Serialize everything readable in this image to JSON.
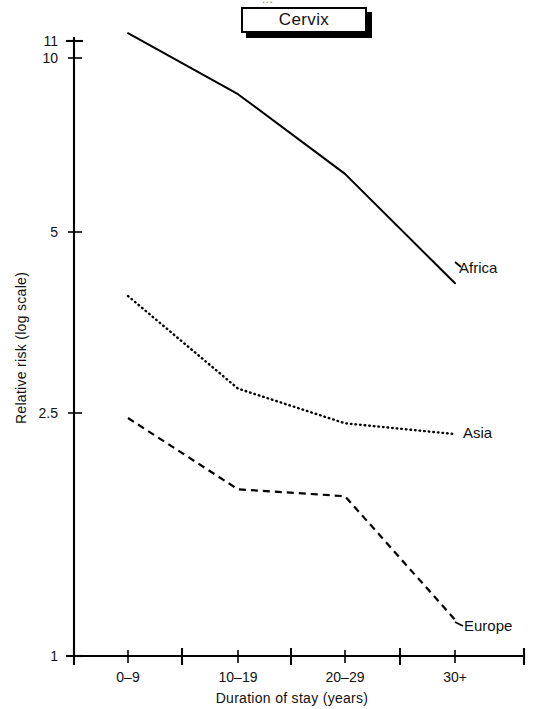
{
  "figure": {
    "clipped_header_text": "...",
    "title": "Cervix"
  },
  "chart_data": {
    "type": "line",
    "title": "Cervix",
    "xlabel": "Duration of stay (years)",
    "ylabel": "Relative risk (log scale)",
    "yscale": "log",
    "ylim": [
      1,
      11
    ],
    "ytick_labels": [
      "11",
      "10",
      "5",
      "2.5",
      "1"
    ],
    "ytick_values": [
      11,
      10,
      5,
      2.5,
      1
    ],
    "categories": [
      "0–9",
      "10–19",
      "20–29",
      "30+"
    ],
    "grid": false,
    "legend": "inline-right-of-series",
    "series": [
      {
        "name": "Africa",
        "line_style": "solid",
        "values": [
          11.0,
          8.7,
          6.4,
          4.2
        ]
      },
      {
        "name": "Asia",
        "line_style": "dotted",
        "values": [
          4.0,
          2.8,
          2.45,
          2.35
        ]
      },
      {
        "name": "Europe",
        "line_style": "dashed",
        "values": [
          2.5,
          1.9,
          1.85,
          1.15
        ]
      }
    ]
  },
  "axes": {
    "y": {
      "label": "Relative risk (log scale)",
      "ticks": [
        {
          "label": "11",
          "y": 41
        },
        {
          "label": "10",
          "y": 58
        },
        {
          "label": "5",
          "y": 232
        },
        {
          "label": "2.5",
          "y": 413
        },
        {
          "label": "1",
          "y": 656
        }
      ]
    },
    "x": {
      "label": "Duration of stay (years)",
      "ticks": [
        {
          "label": "0–9",
          "x": 128
        },
        {
          "label": "10–19",
          "x": 238
        },
        {
          "label": "20–29",
          "x": 345
        },
        {
          "label": "30+",
          "x": 455
        }
      ]
    }
  },
  "series_labels": [
    {
      "name": "Africa",
      "x": 459,
      "y": 268
    },
    {
      "name": "Asia",
      "x": 463,
      "y": 437
    },
    {
      "name": "Europe",
      "x": 464,
      "y": 626
    }
  ]
}
